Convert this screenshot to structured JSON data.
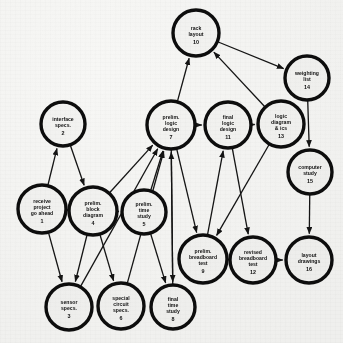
{
  "diagram": {
    "type": "directed-network",
    "background_color": "#f7f7f5",
    "node_fill": "#f4f4f2",
    "node_stroke": "#0d0d0d",
    "edge_color": "#141414",
    "width": 343,
    "height": 343
  },
  "nodes": [
    {
      "id": 1,
      "number": "1",
      "lines": [
        "receive",
        "project",
        "go ahead"
      ],
      "cx": 42,
      "cy": 209,
      "r": 24
    },
    {
      "id": 2,
      "number": "2",
      "lines": [
        "interface",
        "specs."
      ],
      "cx": 63,
      "cy": 124,
      "r": 22
    },
    {
      "id": 3,
      "number": "3",
      "lines": [
        "sensor",
        "specs."
      ],
      "cx": 69,
      "cy": 307,
      "r": 23
    },
    {
      "id": 4,
      "number": "4",
      "lines": [
        "prelim.",
        "block",
        "diagram"
      ],
      "cx": 93,
      "cy": 211,
      "r": 24
    },
    {
      "id": 5,
      "number": "5",
      "lines": [
        "prelim.",
        "time",
        "study"
      ],
      "cx": 144,
      "cy": 212,
      "r": 22
    },
    {
      "id": 6,
      "number": "6",
      "lines": [
        "special",
        "circuit",
        "specs."
      ],
      "cx": 121,
      "cy": 306,
      "r": 23
    },
    {
      "id": 7,
      "number": "7",
      "lines": [
        "prelim.",
        "logic",
        "design"
      ],
      "cx": 171,
      "cy": 125,
      "r": 24
    },
    {
      "id": 8,
      "number": "8",
      "lines": [
        "final",
        "time",
        "study"
      ],
      "cx": 173,
      "cy": 307,
      "r": 22
    },
    {
      "id": 9,
      "number": "9",
      "lines": [
        "prelim.",
        "breadboard",
        "test"
      ],
      "cx": 203,
      "cy": 259,
      "r": 24
    },
    {
      "id": 10,
      "number": "10",
      "lines": [
        "rack",
        "layout"
      ],
      "cx": 196,
      "cy": 33,
      "r": 23
    },
    {
      "id": 11,
      "number": "11",
      "lines": [
        "final",
        "logic",
        "design"
      ],
      "cx": 228,
      "cy": 125,
      "r": 23
    },
    {
      "id": 12,
      "number": "12",
      "lines": [
        "revised",
        "breadboard",
        "test"
      ],
      "cx": 253,
      "cy": 260,
      "r": 23
    },
    {
      "id": 13,
      "number": "13",
      "lines": [
        "logic",
        "diagram",
        "& ics"
      ],
      "cx": 281,
      "cy": 124,
      "r": 23
    },
    {
      "id": 14,
      "number": "14",
      "lines": [
        "weighting",
        "list"
      ],
      "cx": 307,
      "cy": 78,
      "r": 22
    },
    {
      "id": 15,
      "number": "15",
      "lines": [
        "computer",
        "study"
      ],
      "cx": 310,
      "cy": 172,
      "r": 22
    },
    {
      "id": 16,
      "number": "16",
      "lines": [
        "layout",
        "drawings"
      ],
      "cx": 309,
      "cy": 260,
      "r": 23
    }
  ],
  "edges": [
    {
      "from": 1,
      "to": 2
    },
    {
      "from": 1,
      "to": 4
    },
    {
      "from": 1,
      "to": 3
    },
    {
      "from": 2,
      "to": 4
    },
    {
      "from": 4,
      "to": 3
    },
    {
      "from": 4,
      "to": 6
    },
    {
      "from": 4,
      "to": 5
    },
    {
      "from": 4,
      "to": 7
    },
    {
      "from": 5,
      "to": 7
    },
    {
      "from": 5,
      "to": 8
    },
    {
      "from": 6,
      "to": 7
    },
    {
      "from": 3,
      "to": 7
    },
    {
      "from": 7,
      "to": 10
    },
    {
      "from": 7,
      "to": 8
    },
    {
      "from": 7,
      "to": 9
    },
    {
      "from": 7,
      "to": 11
    },
    {
      "from": 8,
      "to": 7
    },
    {
      "from": 9,
      "to": 11
    },
    {
      "from": 9,
      "to": 12
    },
    {
      "from": 10,
      "to": 14
    },
    {
      "from": 11,
      "to": 13
    },
    {
      "from": 11,
      "to": 12
    },
    {
      "from": 13,
      "to": 10
    },
    {
      "from": 13,
      "to": 9
    },
    {
      "from": 14,
      "to": 15
    },
    {
      "from": 12,
      "to": 16
    },
    {
      "from": 15,
      "to": 16
    }
  ]
}
